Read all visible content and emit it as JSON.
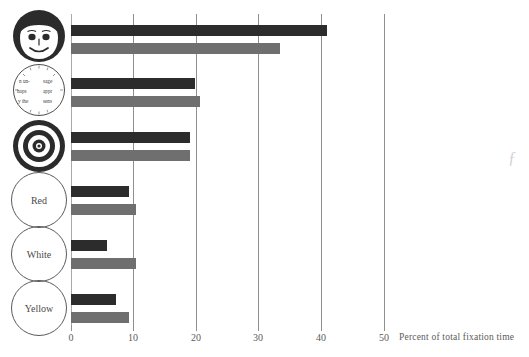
{
  "chart_data": {
    "type": "bar",
    "orientation": "horizontal",
    "title": "",
    "subtitle": "",
    "xlabel": "Percent of total fixation time",
    "ylabel": "",
    "xlim": [
      0,
      50
    ],
    "xticks": [
      0,
      10,
      20,
      30,
      40,
      50
    ],
    "xtick_labels": [
      "0",
      "10",
      "20",
      "30",
      "40",
      "50"
    ],
    "grid": "vertical",
    "legend_position": "none",
    "categories": [
      "face",
      "text",
      "bullseye",
      "Red",
      "White",
      "Yellow"
    ],
    "category_labels": [
      "",
      "",
      "",
      "Red",
      "White",
      "Yellow"
    ],
    "category_icons": [
      "face-icon",
      "text-block-icon",
      "bullseye-icon",
      "circle-label-icon",
      "circle-label-icon",
      "circle-label-icon"
    ],
    "series": [
      {
        "name": "dark",
        "color": "#2c2c2c",
        "values": [
          40.8,
          19.8,
          19.0,
          9.2,
          5.8,
          7.2
        ]
      },
      {
        "name": "light",
        "color": "#6f6f6f",
        "values": [
          33.3,
          20.6,
          19.0,
          10.3,
          10.4,
          9.2
        ]
      }
    ]
  },
  "axis": {
    "caption": "Percent of total fixation time",
    "ticks": [
      {
        "value": "0"
      },
      {
        "value": "10"
      },
      {
        "value": "20"
      },
      {
        "value": "30"
      },
      {
        "value": "40"
      },
      {
        "value": "50"
      }
    ]
  },
  "icons": {
    "face": {
      "name": "face-icon"
    },
    "textblock": {
      "name": "text-block-icon",
      "fragments": [
        "n un-",
        "sage",
        "haps",
        "appr",
        "y the",
        "sens"
      ]
    },
    "bullseye": {
      "name": "bullseye-icon"
    },
    "red": {
      "label": "Red"
    },
    "white": {
      "label": "White"
    },
    "yellow": {
      "label": "Yellow"
    }
  }
}
